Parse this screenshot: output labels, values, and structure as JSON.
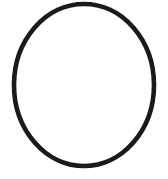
{
  "page": {
    "width": 168,
    "height": 179,
    "background_color": "#ffffff",
    "interior_color": "#fdfdfd"
  },
  "figure": {
    "name": "ellipse-outline",
    "shape_type": "ellipse",
    "stroke_color": "#1a1a1a",
    "stroke_width": 4.6,
    "fill_color": "none",
    "center_x": 84,
    "center_y": 85,
    "radius_x": 70,
    "radius_y": 81,
    "rotation_deg": 0,
    "extent_left": 14,
    "extent_right": 154,
    "extent_top": 5,
    "extent_bottom": 166,
    "label": "Ellipse"
  },
  "chart_data": {
    "type": "scatter",
    "title": "",
    "xlabel": "",
    "ylabel": "",
    "xlim": [
      0,
      168
    ],
    "ylim": [
      0,
      179
    ],
    "grid": false,
    "legend": "none",
    "series": [
      {
        "name": "ellipse-outline",
        "shape": "ellipse",
        "center": [
          84,
          85
        ],
        "semi_axes": [
          70,
          81
        ],
        "stroke": "#1a1a1a",
        "stroke_width": 4.6
      }
    ]
  }
}
